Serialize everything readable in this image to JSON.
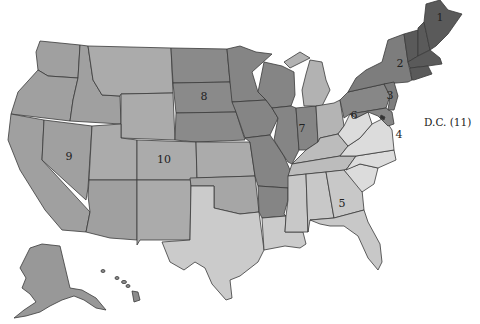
{
  "map": {
    "title": "United States regional map",
    "regions": [
      {
        "id": "1",
        "label": "1",
        "color": "#5a5a5a",
        "states": [
          "Maine",
          "New Hampshire",
          "Vermont",
          "Massachusetts",
          "Rhode Island",
          "Connecticut"
        ]
      },
      {
        "id": "2",
        "label": "2",
        "color": "#7d7d7d",
        "states": [
          "New York",
          "New Jersey"
        ]
      },
      {
        "id": "3",
        "label": "3",
        "color": "#878787",
        "states": [
          "Pennsylvania",
          "Delaware",
          "Maryland"
        ]
      },
      {
        "id": "4",
        "label": "4",
        "color": "#dcdcdc",
        "states": [
          "Virginia",
          "West Virginia",
          "North Carolina",
          "South Carolina"
        ]
      },
      {
        "id": "5",
        "label": "5",
        "color": "#c8c8c8",
        "states": [
          "Alabama",
          "Mississippi",
          "Georgia",
          "Florida",
          "Tennessee"
        ]
      },
      {
        "id": "6",
        "label": "6",
        "color": "#b4b4b4",
        "states": [
          "Ohio",
          "Michigan",
          "Kentucky"
        ]
      },
      {
        "id": "7",
        "label": "7",
        "color": "#858585",
        "states": [
          "Illinois",
          "Indiana",
          "Wisconsin",
          "Missouri",
          "Arkansas",
          "Iowa",
          "Minnesota"
        ]
      },
      {
        "id": "8",
        "label": "8",
        "color": "#8a8a8a",
        "states": [
          "North Dakota",
          "South Dakota",
          "Nebraska"
        ]
      },
      {
        "id": "9",
        "label": "9",
        "color": "#a0a0a0",
        "states": [
          "California",
          "Nevada",
          "Oregon",
          "Washington",
          "Idaho",
          "Arizona",
          "Alaska",
          "Hawaii"
        ]
      },
      {
        "id": "10",
        "label": "10",
        "color": "#ababab",
        "states": [
          "Montana",
          "Wyoming",
          "Colorado",
          "Utah",
          "New Mexico",
          "Kansas",
          "Oklahoma",
          "Texas",
          "Louisiana"
        ]
      }
    ],
    "dc_label": "D.C. (11)"
  }
}
